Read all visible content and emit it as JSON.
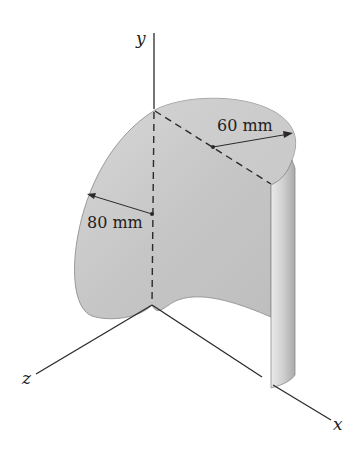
{
  "figure": {
    "axes": {
      "x_label": "x",
      "y_label": "y",
      "z_label": "z"
    },
    "dimensions": {
      "radius_top_label": "60 mm",
      "radius_side_label": "80 mm"
    },
    "colors": {
      "surface_fill": "#c9c9c9",
      "surface_light": "#dcdcdc",
      "edge_fill": "#d6d6d6",
      "line": "#2a2a2a",
      "background": "#ffffff"
    }
  }
}
